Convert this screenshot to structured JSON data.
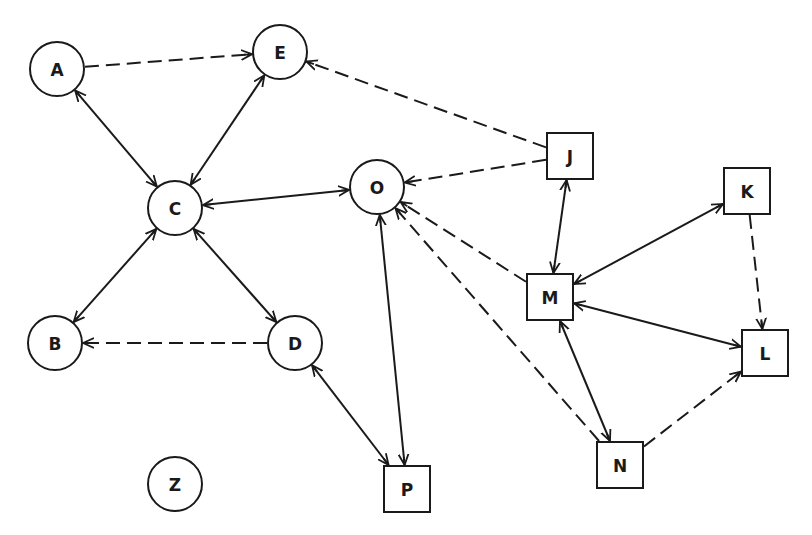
{
  "diagram": {
    "type": "directed-graph",
    "legend": {
      "circle": "circle node",
      "square": "square node",
      "solid": "solid edge",
      "dashed": "dashed edge"
    },
    "nodes": [
      {
        "id": "A",
        "label": "A",
        "shape": "circle",
        "x": 57,
        "y": 69,
        "r": 27
      },
      {
        "id": "E",
        "label": "E",
        "shape": "circle",
        "x": 280,
        "y": 52,
        "r": 27
      },
      {
        "id": "C",
        "label": "C",
        "shape": "circle",
        "x": 175,
        "y": 208,
        "r": 27
      },
      {
        "id": "O",
        "label": "O",
        "shape": "circle",
        "x": 377,
        "y": 187,
        "r": 27
      },
      {
        "id": "B",
        "label": "B",
        "shape": "circle",
        "x": 55,
        "y": 343,
        "r": 27
      },
      {
        "id": "D",
        "label": "D",
        "shape": "circle",
        "x": 295,
        "y": 343,
        "r": 27
      },
      {
        "id": "Z",
        "label": "Z",
        "shape": "circle",
        "x": 175,
        "y": 484,
        "r": 27
      },
      {
        "id": "J",
        "label": "J",
        "shape": "square",
        "x": 570,
        "y": 156,
        "s": 46
      },
      {
        "id": "K",
        "label": "K",
        "shape": "square",
        "x": 747,
        "y": 191,
        "s": 46
      },
      {
        "id": "M",
        "label": "M",
        "shape": "square",
        "x": 550,
        "y": 297,
        "s": 46
      },
      {
        "id": "L",
        "label": "L",
        "shape": "square",
        "x": 765,
        "y": 353,
        "s": 46
      },
      {
        "id": "N",
        "label": "N",
        "shape": "square",
        "x": 620,
        "y": 465,
        "s": 46
      },
      {
        "id": "P",
        "label": "P",
        "shape": "square",
        "x": 407,
        "y": 489,
        "s": 46
      }
    ],
    "edges": [
      {
        "from": "A",
        "to": "E",
        "style": "dashed",
        "direction": "forward"
      },
      {
        "from": "A",
        "to": "C",
        "style": "solid",
        "direction": "both"
      },
      {
        "from": "E",
        "to": "C",
        "style": "solid",
        "direction": "both"
      },
      {
        "from": "J",
        "to": "E",
        "style": "dashed",
        "direction": "forward"
      },
      {
        "from": "J",
        "to": "O",
        "style": "dashed",
        "direction": "forward"
      },
      {
        "from": "C",
        "to": "O",
        "style": "solid",
        "direction": "both"
      },
      {
        "from": "C",
        "to": "B",
        "style": "solid",
        "direction": "both"
      },
      {
        "from": "C",
        "to": "D",
        "style": "solid",
        "direction": "both"
      },
      {
        "from": "D",
        "to": "B",
        "style": "dashed",
        "direction": "forward"
      },
      {
        "from": "D",
        "to": "P",
        "style": "solid",
        "direction": "both"
      },
      {
        "from": "O",
        "to": "P",
        "style": "solid",
        "direction": "both"
      },
      {
        "from": "M",
        "to": "O",
        "style": "dashed",
        "direction": "forward"
      },
      {
        "from": "N",
        "to": "O",
        "style": "dashed",
        "direction": "forward"
      },
      {
        "from": "J",
        "to": "M",
        "style": "solid",
        "direction": "both"
      },
      {
        "from": "K",
        "to": "M",
        "style": "solid",
        "direction": "both"
      },
      {
        "from": "K",
        "to": "L",
        "style": "dashed",
        "direction": "forward"
      },
      {
        "from": "M",
        "to": "L",
        "style": "solid",
        "direction": "both"
      },
      {
        "from": "M",
        "to": "N",
        "style": "solid",
        "direction": "both"
      },
      {
        "from": "N",
        "to": "L",
        "style": "dashed",
        "direction": "forward"
      }
    ]
  }
}
